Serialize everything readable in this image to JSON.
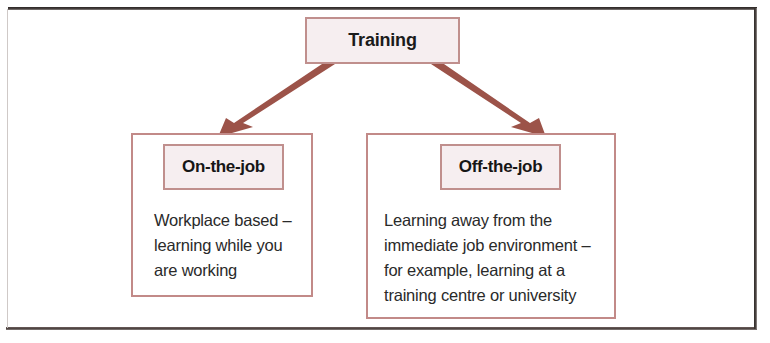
{
  "diagram": {
    "title_node": {
      "label": "Training"
    },
    "branches": [
      {
        "id": "on-the-job",
        "heading": "On-the-job",
        "body_lines": [
          "Workplace based –",
          "learning while you",
          "are working"
        ]
      },
      {
        "id": "off-the-job",
        "heading": "Off-the-job",
        "body_lines": [
          "Learning away from the",
          "immediate job environment –",
          "for example, learning at a",
          "training centre or university"
        ]
      }
    ],
    "connectors": [
      {
        "name": "training-to-on-the-job",
        "from": "Training",
        "to": "On-the-job",
        "style": "solid-arrow"
      },
      {
        "name": "training-to-off-the-job",
        "from": "Training",
        "to": "Off-the-job",
        "style": "solid-arrow"
      }
    ],
    "colors": {
      "box_border": "#c08f8d",
      "box_fill": "#f6eef0",
      "arrow": "#9c5349",
      "frame": "#3a3432",
      "text": "#1b1b1b"
    }
  }
}
